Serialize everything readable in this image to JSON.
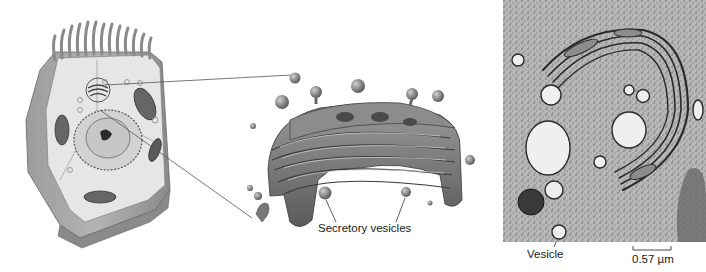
{
  "figure": {
    "panels": [
      {
        "id": "cell-illustration",
        "description": "Cutaway of animal cell showing location of Golgi apparatus"
      },
      {
        "id": "golgi-illustration",
        "description": "Enlarged 3D drawing of Golgi apparatus stacks with vesicles"
      },
      {
        "id": "electron-micrograph",
        "description": "Transmission electron micrograph of Golgi apparatus"
      }
    ],
    "labels": {
      "secretory_vesicles": "Secretory vesicles",
      "vesicle": "Vesicle",
      "scale_bar": "0.57 µm"
    },
    "colors": {
      "cell_membrane": "#8e8e8e",
      "cell_interior": "#e6e6e6",
      "golgi_fill": "#7d7d7d",
      "micrograph_bg": "#b9b9b9",
      "text": "#1a1a1a"
    }
  }
}
